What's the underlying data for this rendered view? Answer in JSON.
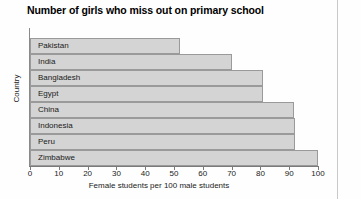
{
  "chart_data": {
    "type": "bar",
    "orientation": "horizontal",
    "title": "Number of girls who miss out on primary school",
    "xlabel": "Female students per 100 male students",
    "ylabel": "Country",
    "categories": [
      "Pakistan",
      "India",
      "Bangladesh",
      "Egypt",
      "China",
      "Indonesia",
      "Peru",
      "Zimbabwe"
    ],
    "values": [
      52,
      70,
      81,
      81,
      91.5,
      92,
      92,
      100
    ],
    "xlim": [
      0,
      100
    ],
    "xticks": [
      0,
      10,
      20,
      30,
      40,
      50,
      60,
      70,
      80,
      90,
      100
    ],
    "xtick_labels": [
      "0",
      "10",
      "20",
      "30",
      "40",
      "50",
      "60",
      "70",
      "80",
      "90",
      "100"
    ],
    "grid": false,
    "legend": null,
    "bar_fill": "#d4d4d4",
    "bar_stroke": "#9a9a9a",
    "axis_color": "#7a7a7a",
    "background": "#fefefe"
  }
}
